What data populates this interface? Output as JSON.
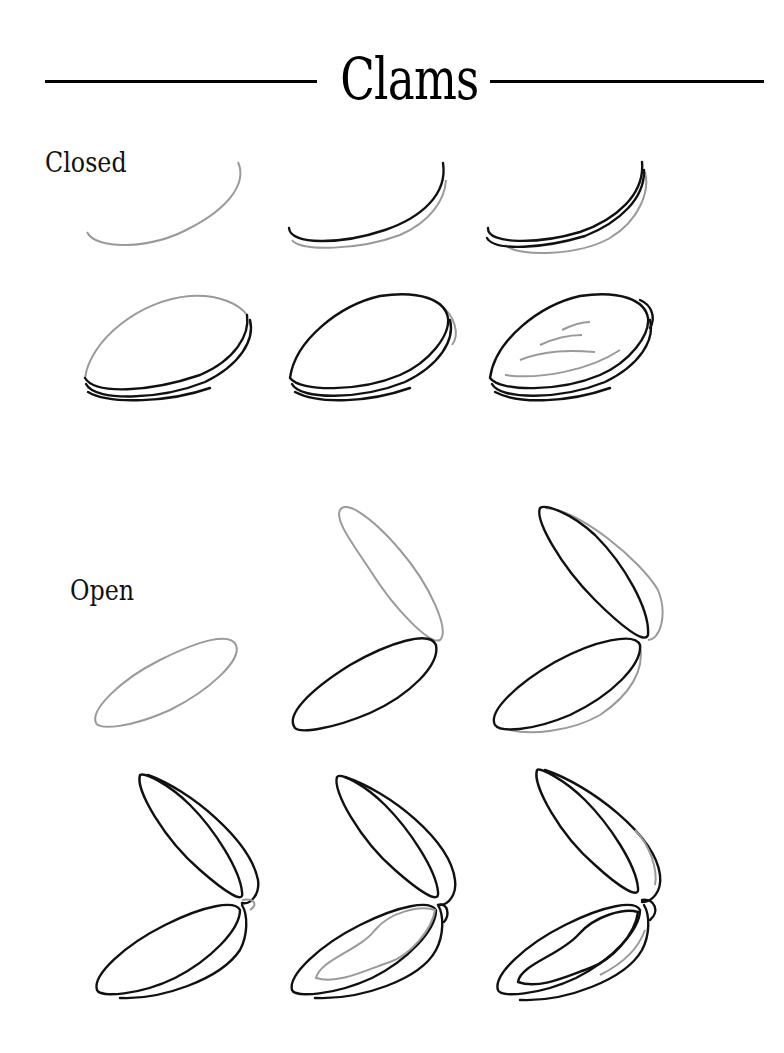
{
  "header": {
    "title": "Clams"
  },
  "sections": [
    {
      "label": "Closed",
      "steps": [
        {
          "step": 1,
          "description": "gray arc guide"
        },
        {
          "step": 2,
          "description": "black arc over gray arc"
        },
        {
          "step": 3,
          "description": "double black arc with gray lower arc"
        },
        {
          "step": 4,
          "description": "gray shell top outline over black rim"
        },
        {
          "step": 5,
          "description": "black shell outline with hinge hint"
        },
        {
          "step": 6,
          "description": "finished closed shell with gray growth rings"
        }
      ]
    },
    {
      "label": "Open",
      "steps": [
        {
          "step": 1,
          "description": "gray lower valve oval"
        },
        {
          "step": 2,
          "description": "black lower valve, gray upper valve"
        },
        {
          "step": 3,
          "description": "both valves in black with gray rims"
        },
        {
          "step": 4,
          "description": "valves with rims and gray hinge"
        },
        {
          "step": 5,
          "description": "hinge detail with gray inner body"
        },
        {
          "step": 6,
          "description": "finished open clam with inner body"
        }
      ]
    }
  ],
  "colors": {
    "ink": "#111111",
    "guide": "#9a9a9a",
    "background": "#ffffff"
  }
}
